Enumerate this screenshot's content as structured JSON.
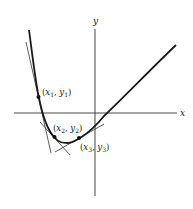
{
  "diagram": {
    "title": "",
    "axes": {
      "x_label": "x",
      "y_label": "y"
    },
    "points": [
      {
        "id": "p1",
        "label": "(x₁, y₁)",
        "sub": "1"
      },
      {
        "id": "p2",
        "label": "(x₂, y₂)",
        "sub": "2"
      },
      {
        "id": "p3",
        "label": "(x₃, y₃)",
        "sub": "3"
      }
    ],
    "colors": {
      "curve": "#1a1a1a",
      "axis": "#333333",
      "tangent": "#333333",
      "background": "#ffffff"
    }
  }
}
